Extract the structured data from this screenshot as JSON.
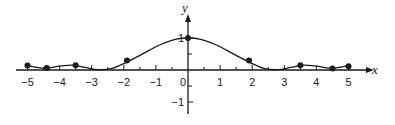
{
  "chart_data": {
    "type": "line",
    "title": "",
    "xlabel": "x",
    "ylabel": "y",
    "xlim": [
      -5,
      5
    ],
    "ylim": [
      -1,
      1
    ],
    "grid": false,
    "legend": null,
    "x_ticks": [
      -5,
      -4,
      -3,
      -2,
      -1,
      0,
      1,
      2,
      3,
      4,
      5
    ],
    "x_tick_labels": [
      "−5",
      "−4",
      "−3",
      "−2",
      "−1",
      "0",
      "1",
      "2",
      "3",
      "4",
      "5"
    ],
    "x_minor_ticks": [
      -4.5,
      -3.5,
      -2.5,
      -1.5,
      -0.5,
      0.5,
      1.5,
      2.5,
      3.5,
      4.5
    ],
    "y_ticks": [
      -1,
      1
    ],
    "y_tick_labels": [
      "−1",
      "1"
    ],
    "y_minor_ticks": [
      -0.5,
      0.5
    ],
    "series": [
      {
        "name": "curve",
        "style": "smooth-line",
        "x": [
          -5,
          -4.7,
          -4.4,
          -4.0,
          -3.6,
          -3.2,
          -2.8,
          -2.4,
          -2.0,
          -1.6,
          -1.2,
          -0.8,
          -0.4,
          0,
          0.4,
          0.8,
          1.2,
          1.6,
          2.0,
          2.4,
          2.8,
          3.2,
          3.6,
          4.0,
          4.4,
          4.7,
          5
        ],
        "y": [
          0.14,
          0.08,
          0.06,
          0.12,
          0.15,
          0.08,
          0.01,
          0.04,
          0.2,
          0.4,
          0.62,
          0.82,
          0.96,
          1.0,
          0.96,
          0.82,
          0.62,
          0.4,
          0.2,
          0.04,
          0.01,
          0.08,
          0.15,
          0.12,
          0.06,
          0.08,
          0.14
        ]
      },
      {
        "name": "marked-points",
        "style": "points",
        "x": [
          -5,
          -4.4,
          -3.5,
          -1.9,
          0,
          1.9,
          3.5,
          4.5,
          5
        ],
        "y": [
          0.14,
          0.06,
          0.15,
          0.3,
          1.0,
          0.3,
          0.15,
          0.05,
          0.12
        ]
      }
    ]
  },
  "axes": {
    "x_label": "x",
    "y_label": "y"
  },
  "colors": {
    "line": "#1a1a1a",
    "axis": "#1a1a1a",
    "background": "#ffffff"
  }
}
